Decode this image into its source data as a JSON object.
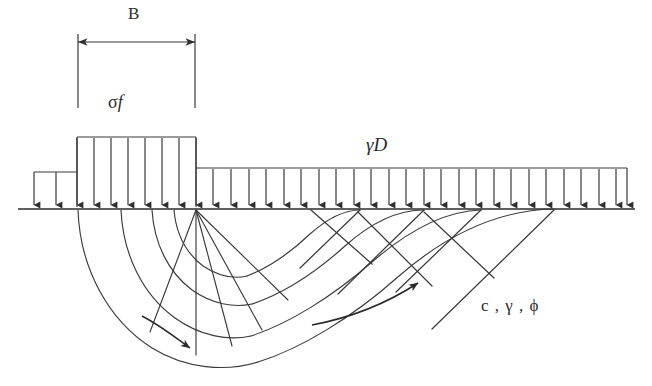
{
  "figure": {
    "background_color": "#ffffff",
    "line_color": "#333333",
    "text_color": "#2b2b2b"
  },
  "labels": {
    "footing_width": "B",
    "contact_pressure_sigma": "σ",
    "contact_pressure_f": "f",
    "surcharge": "γD",
    "soil_properties": "c , γ , ϕ"
  },
  "geometry": {
    "ground_line_y": 209,
    "ground_line_x1": 18,
    "ground_line_x2": 635,
    "footing_left_x": 77,
    "footing_right_x": 196,
    "footing_top_y": 137,
    "footing_arrow_count": 7,
    "step_left_x": 34,
    "step_top_y": 172,
    "step_arrow_count": 2,
    "surcharge_left_x": 196,
    "surcharge_right_x": 627,
    "surcharge_top_y": 168,
    "surcharge_arrow_count": 25,
    "dimension_line_y": 42,
    "dimension_tick_bottom_y": 108,
    "fan_center_x": 196,
    "fan_center_y": 209,
    "failure_left_x": 78,
    "failure_bottom_y": 368,
    "passive_wedge_right_x": 554
  },
  "annotations": {
    "flow_arrow_left": "downward-curved-flow-arrow",
    "flow_arrow_right": "upward-curved-flow-arrow",
    "dimension_arrow_left": "left-arrowhead",
    "dimension_arrow_right": "right-arrowhead"
  }
}
